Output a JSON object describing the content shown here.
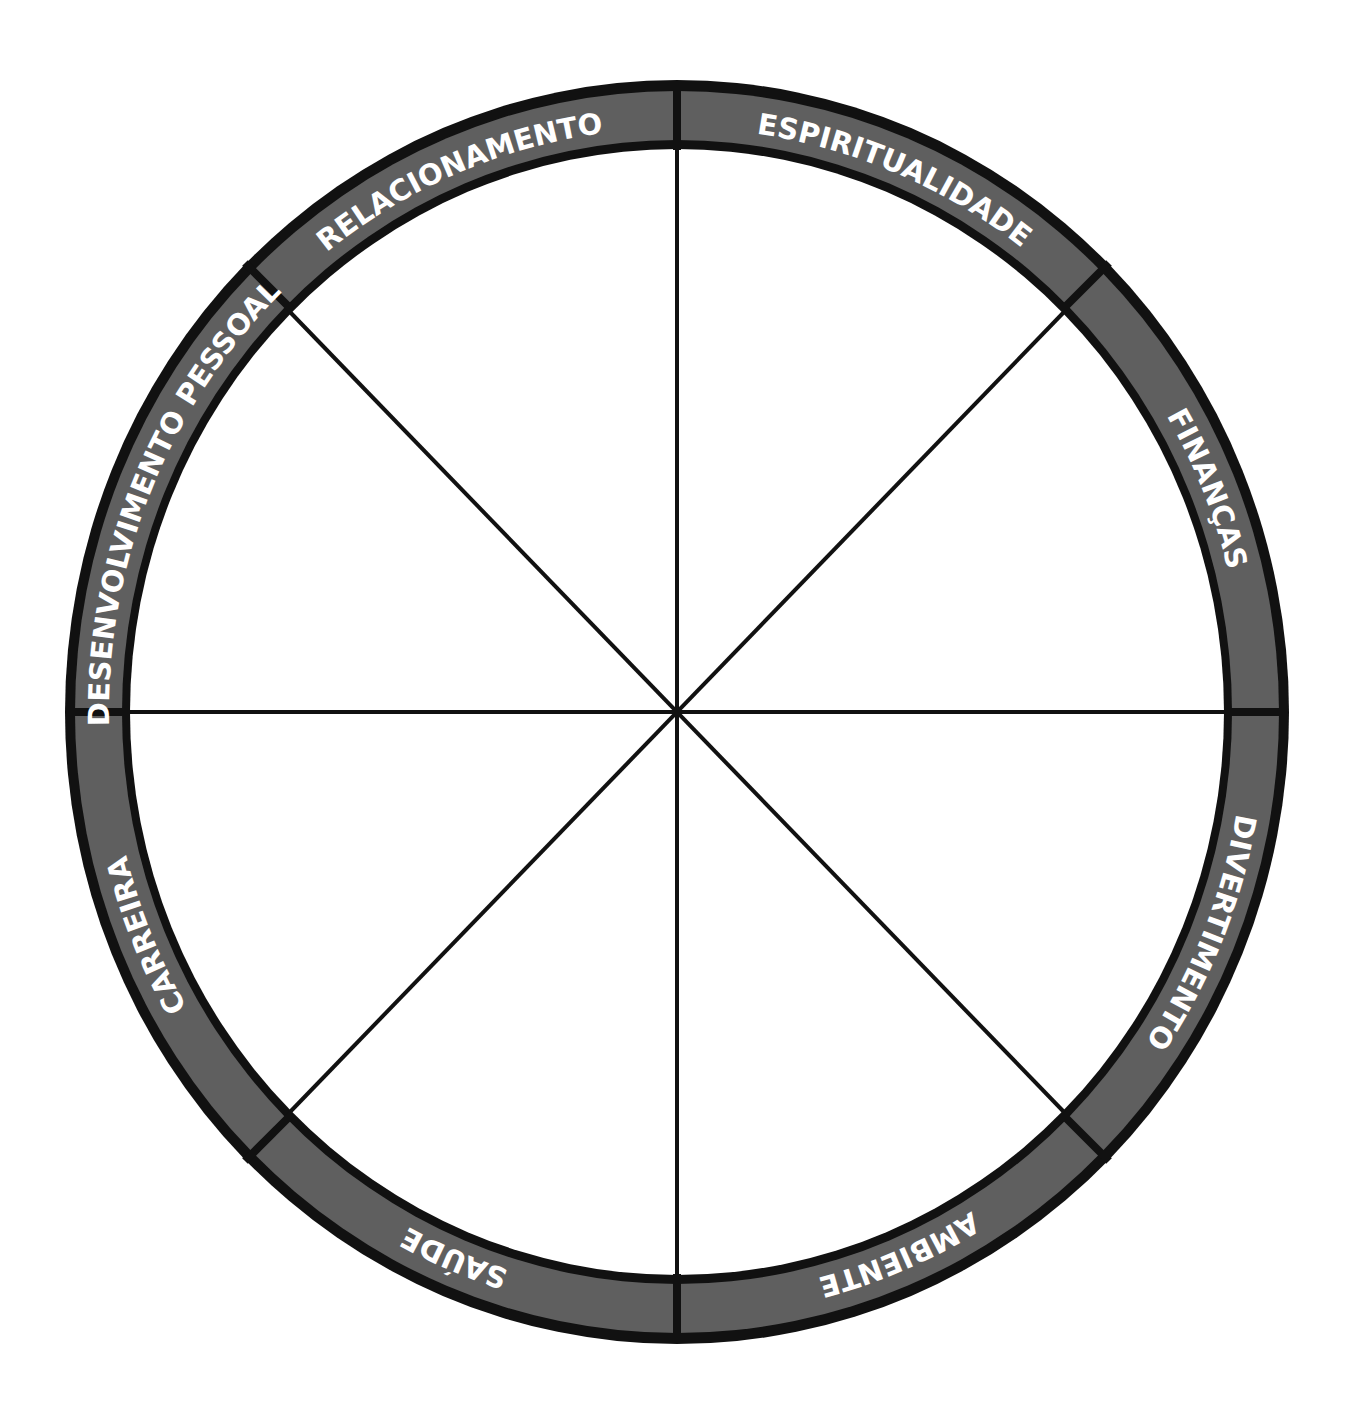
{
  "diagram": {
    "type": "wheel-of-life",
    "colors": {
      "ring_fill": "#5f5f5f",
      "border": "#111111",
      "background": "#ffffff",
      "label_text": "#ffffff"
    },
    "segments": [
      {
        "label": "RELACIONAMENTO",
        "offset": "68.75%"
      },
      {
        "label": "ESPIRITUALIDADE",
        "offset": "81.25%"
      },
      {
        "label": "FINANÇAS",
        "offset": "93.75%"
      },
      {
        "label": "DIVERTIMENTO",
        "offset": "6.25%"
      },
      {
        "label": "AMBIENTE",
        "offset": "18.75%"
      },
      {
        "label": "SAÚDE",
        "offset": "31.25%"
      },
      {
        "label": "CARREIRA",
        "offset": "43.75%"
      },
      {
        "label": "DESENVOLVIMENTO PESSOAL",
        "offset": "56.25%"
      }
    ]
  }
}
